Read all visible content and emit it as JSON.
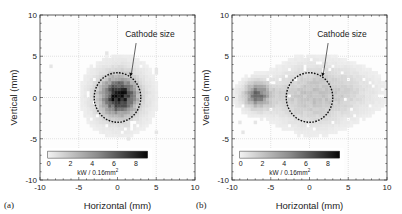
{
  "figure": {
    "panels": [
      {
        "letter": "(a)",
        "xlabel": "Horizontal  (mm)",
        "ylabel": "Vertical  (mm)",
        "annotation": "Cathode size",
        "colorbar_label": "kW / 0.16mm",
        "colorbar_label_sup": "2",
        "colorbar_ticks": [
          "0",
          "2",
          "4",
          "6",
          "8"
        ],
        "xticks": [
          "-10",
          "-5",
          "0",
          "5",
          "10"
        ],
        "yticks": [
          "10",
          "5",
          "0",
          "-5",
          "-10"
        ]
      },
      {
        "letter": "(b)",
        "xlabel": "Horizontal  (mm)",
        "ylabel": "Vertical  (mm)",
        "annotation": "Cathode size",
        "colorbar_label": "kW / 0.16mm",
        "colorbar_label_sup": "2",
        "colorbar_ticks": [
          "0",
          "2",
          "4",
          "6",
          "8"
        ],
        "xticks": [
          "-10",
          "-5",
          "0",
          "5",
          "10"
        ],
        "yticks": [
          "10",
          "5",
          "0",
          "-5",
          "-10"
        ]
      }
    ]
  },
  "chart_data": [
    {
      "type": "heatmap",
      "panel": "(a)",
      "title": "",
      "xlabel": "Horizontal (mm)",
      "ylabel": "Vertical (mm)",
      "xlim": [
        -10,
        10
      ],
      "ylim": [
        -10,
        10
      ],
      "grid": true,
      "colorbar": {
        "label": "kW / 0.16mm^2",
        "range": [
          0,
          9
        ],
        "ticks": [
          0,
          2,
          4,
          6,
          8
        ],
        "colormap": "gray_r"
      },
      "annotations": [
        {
          "text": "Cathode size",
          "target": "dashed circle, center (0,0), radius ~3 mm"
        }
      ],
      "cathode_circle": {
        "cx": 0,
        "cy": 0,
        "r": 3
      },
      "blobs": [
        {
          "cx": 0,
          "cy": 0,
          "sx": 1.3,
          "sy": 1.3,
          "peak": 7.5
        },
        {
          "cx": 0,
          "cy": 0,
          "sx": 2.6,
          "sy": 2.6,
          "peak": 1.8
        }
      ],
      "description": "Power density concentrated at center, peak ~7-8 kW/0.16mm^2 at (0,0), falling off within cathode radius (~3 mm)"
    },
    {
      "type": "heatmap",
      "panel": "(b)",
      "title": "",
      "xlabel": "Horizontal (mm)",
      "ylabel": "Vertical (mm)",
      "xlim": [
        -10,
        10
      ],
      "ylim": [
        -10,
        10
      ],
      "grid": true,
      "colorbar": {
        "label": "kW / 0.16mm^2",
        "range": [
          0,
          9
        ],
        "ticks": [
          0,
          2,
          4,
          6,
          8
        ],
        "colormap": "gray_r"
      },
      "annotations": [
        {
          "text": "Cathode size",
          "target": "dashed circle, center (0,0), radius ~3 mm"
        }
      ],
      "cathode_circle": {
        "cx": 0,
        "cy": 0,
        "r": 3
      },
      "blobs": [
        {
          "cx": -7,
          "cy": 0.2,
          "sx": 0.9,
          "sy": 0.9,
          "peak": 4.0
        },
        {
          "cx": -6.5,
          "cy": 0,
          "sx": 2.0,
          "sy": 1.3,
          "peak": 1.4
        },
        {
          "cx": 0,
          "cy": 0,
          "sx": 3.2,
          "sy": 2.6,
          "peak": 1.6
        },
        {
          "cx": 4.5,
          "cy": 0.5,
          "sx": 3.6,
          "sy": 2.0,
          "peak": 0.8
        }
      ],
      "description": "Broad low-level distribution across x from -9 to 9 mm, hotspot ~4 kW/0.16mm^2 near (-7, 0), uniform ~1.5 within cathode circle"
    }
  ]
}
